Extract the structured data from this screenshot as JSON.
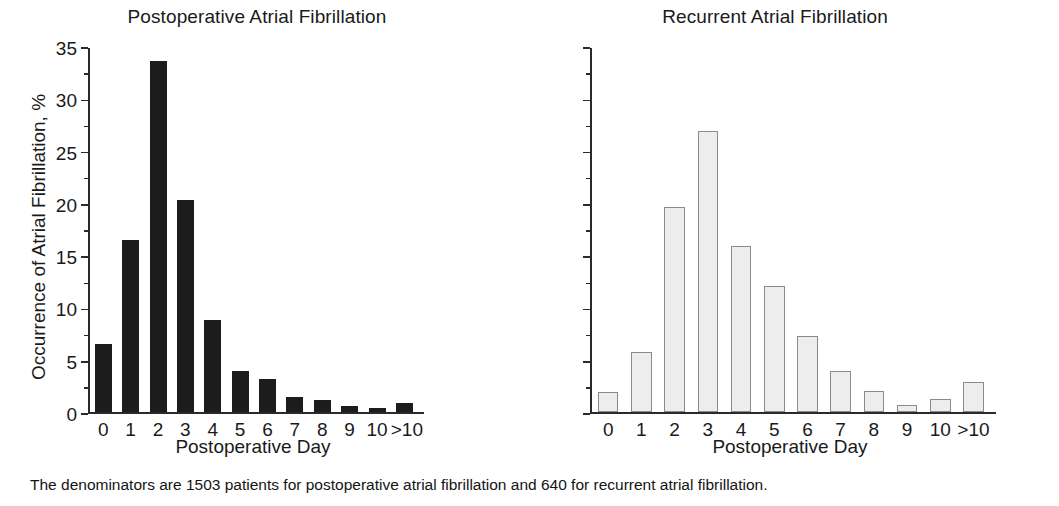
{
  "figure": {
    "caption": "The denominators are 1503 patients for postoperative atrial fibrillation and 640 for recurrent atrial fibrillation.",
    "y_axis_title": "Occurrence of Atrial Fibrillation, %",
    "x_axis_title_left": "Postoperative Day",
    "x_axis_title_right": "Postoperative Day",
    "colors": {
      "left_bar_fill": "#1c1c1c",
      "right_bar_fill": "#ededed",
      "right_bar_stroke": "#8a8a8a",
      "axis": "#2a2a2a",
      "text": "#1a1a1a",
      "background": "#ffffff"
    }
  },
  "chart_data": [
    {
      "type": "bar",
      "title": "Postoperative Atrial Fibrillation",
      "xlabel": "Postoperative Day",
      "ylabel": "Occurrence of Atrial Fibrillation, %",
      "categories": [
        "0",
        "1",
        "2",
        "3",
        "4",
        "5",
        "6",
        "7",
        "8",
        "9",
        "10",
        ">10"
      ],
      "values": [
        6.6,
        16.6,
        33.8,
        20.4,
        8.9,
        4.0,
        3.2,
        1.5,
        1.2,
        0.6,
        0.4,
        0.9
      ],
      "ylim": [
        0,
        35
      ],
      "yticks": [
        0,
        5,
        10,
        15,
        20,
        25,
        30,
        35
      ],
      "ytick_labels": [
        "0",
        "5",
        "10",
        "15",
        "20",
        "25",
        "30",
        "35"
      ],
      "grid": false,
      "legend": false,
      "bar_style": "solid-black",
      "denominator": 1503
    },
    {
      "type": "bar",
      "title": "Recurrent Atrial Fibrillation",
      "xlabel": "Postoperative Day",
      "ylabel": "",
      "categories": [
        "0",
        "1",
        "2",
        "3",
        "4",
        "5",
        "6",
        "7",
        "8",
        "9",
        "10",
        ">10"
      ],
      "values": [
        2.0,
        5.8,
        19.7,
        27.0,
        16.0,
        12.1,
        7.3,
        4.0,
        2.1,
        0.7,
        1.3,
        2.9
      ],
      "ylim": [
        0,
        35
      ],
      "yticks": [
        0,
        5,
        10,
        15,
        20,
        25,
        30,
        35
      ],
      "ytick_labels": [
        "",
        "",
        "",
        "",
        "",
        "",
        "",
        ""
      ],
      "grid": false,
      "legend": false,
      "bar_style": "light-gray-outlined",
      "denominator": 640
    }
  ]
}
